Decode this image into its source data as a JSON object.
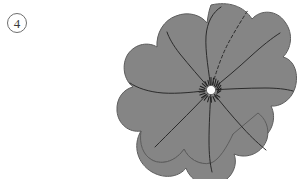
{
  "figure": {
    "canvas": {
      "width": 305,
      "height": 179,
      "background": "#ffffff"
    },
    "label": {
      "text": "4",
      "style": "circled",
      "circle": {
        "cx": 17,
        "cy": 23,
        "r": 9.5
      },
      "stroke_color": "#6e6e6e",
      "text_color": "#3a3a3a"
    },
    "subject": {
      "name": "flower-top-view",
      "description": "Gray lobed flower seen from above with radiating veins and a pale center disc",
      "petal_fill": "#858585",
      "petal_stroke": "#5a5a5a",
      "vein_color": "#2b2b2b",
      "center_fill": "#fbfbfb",
      "center_stroke": "#4a4a4a",
      "stamen_color": "#1f1f1f",
      "center": {
        "cx": 211,
        "cy": 90,
        "r": 4.6
      },
      "bounds": {
        "x": 122,
        "y": 3,
        "width": 174,
        "height": 176
      },
      "lobe_count": 8,
      "vein_count": 7,
      "stamen_tick_count": 18,
      "dashed_vein_count": 1,
      "petal_outline_path": "M 211 5 C 228 1 244 6 252 19 C 261 9 277 10 285 22 C 294 34 291 49 283 57 C 295 60 299 75 295 88 C 291 101 279 107 271 106 C 277 118 272 133 261 139 C 250 145 239 141 233 134 C 233 149 223 161 211 163 C 199 166 188 158 184 149 C 177 160 163 166 152 160 C 140 153 137 140 141 131 C 129 133 118 124 117 111 C 116 98 124 89 133 87 C 124 80 121 65 128 54 C 136 43 149 42 157 47 C 156 33 164 20 176 16 C 188 11 201 15 207 23 C 208 16 209 10 211 5 Z",
      "veins": [
        {
          "id": "vein-up",
          "dashed": false,
          "path": "M 211 90 C 209 72 205 52 206 36 C 207 22 213 12 221 7"
        },
        {
          "id": "vein-up-right-dashed",
          "dashed": true,
          "path": "M 211 90 C 216 72 222 54 230 40 C 236 29 243 18 248 10"
        },
        {
          "id": "vein-right",
          "dashed": false,
          "path": "M 211 90 C 224 80 238 68 251 56 C 262 46 272 38 280 33"
        },
        {
          "id": "vein-far-right",
          "dashed": false,
          "path": "M 211 90 C 228 89 248 88 265 88 C 276 88 286 89 292 90"
        },
        {
          "id": "vein-left",
          "dashed": false,
          "path": "M 211 90 C 196 92 178 94 163 93 C 149 92 137 88 130 83"
        },
        {
          "id": "vein-upper-left",
          "dashed": false,
          "path": "M 211 90 C 200 78 189 65 180 54 C 173 45 169 38 167 32"
        },
        {
          "id": "vein-lower-left",
          "dashed": false,
          "path": "M 211 90 C 201 101 189 113 178 124 C 169 133 161 141 155 147"
        },
        {
          "id": "vein-down",
          "dashed": false,
          "path": "M 211 90 C 210 107 209 126 209 141 C 209 153 210 163 212 171"
        },
        {
          "id": "vein-lower-right",
          "dashed": false,
          "path": "M 211 90 C 221 103 232 116 243 128 C 252 138 260 145 266 150"
        }
      ]
    }
  }
}
